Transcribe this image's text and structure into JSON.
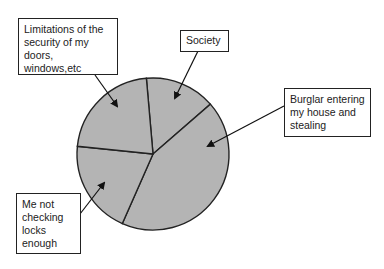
{
  "chart_data": {
    "type": "pie",
    "title": "",
    "categories": [
      "Society",
      "Burglar entering my house and stealing",
      "Me not checking locks enough",
      "Limitations of the security of my doors, windows,etc"
    ],
    "values": [
      15,
      43,
      20,
      22
    ],
    "unit": "percent (estimated from slice angles)",
    "legend": "callout boxes with arrows",
    "colors": {
      "slice_fill": "#b4b4b4",
      "outline": "#222222",
      "background": "#ffffff"
    }
  },
  "labels": {
    "limitations": "Limitations of the\nsecurity of my\ndoors, windows,etc",
    "society": "Society",
    "burglar": "Burglar entering\nmy house and\nstealing",
    "me_not": "Me not\nchecking\nlocks\nenough"
  }
}
